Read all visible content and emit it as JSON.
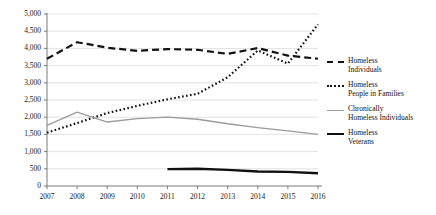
{
  "chart_data": {
    "type": "line",
    "title": "",
    "xlabel": "",
    "ylabel": "",
    "x": [
      2007,
      2008,
      2009,
      2010,
      2011,
      2012,
      2013,
      2014,
      2015,
      2016
    ],
    "categories": [
      "2007",
      "2008",
      "2009",
      "2010",
      "2011",
      "2012",
      "2013",
      "2014",
      "2015",
      "2016"
    ],
    "ylim": [
      0,
      5000
    ],
    "xlim": [
      2007,
      2016
    ],
    "ytick_values": [
      0,
      500,
      1000,
      1500,
      2000,
      2500,
      3000,
      3500,
      4000,
      4500,
      5000
    ],
    "ytick_labels": [
      "0",
      "500",
      "1,000",
      "1,500",
      "2,000",
      "2,500",
      "3,000",
      "3,500",
      "4,000",
      "4,500",
      "5,000"
    ],
    "grid": true,
    "legend_position": "right",
    "series": [
      {
        "name": "Homeless Individuals",
        "legend_label_line1": "Homeless",
        "legend_label_line2": "Individuals",
        "style": "dashed",
        "color": "#121212",
        "width": 2.2,
        "x": [
          2007,
          2008,
          2009,
          2010,
          2011,
          2012,
          2013,
          2014,
          2015,
          2016
        ],
        "values": [
          3700,
          4180,
          4020,
          3930,
          3980,
          3960,
          3840,
          4010,
          3790,
          3700
        ]
      },
      {
        "name": "Homeless People in Families",
        "legend_label_line1": "Homeless",
        "legend_label_line2": "People in Families",
        "style": "dotted",
        "color": "#121212",
        "width": 2.2,
        "x": [
          2007,
          2008,
          2009,
          2010,
          2011,
          2012,
          2013,
          2014,
          2015,
          2016
        ],
        "values": [
          1550,
          1830,
          2120,
          2330,
          2520,
          2680,
          3160,
          3940,
          3560,
          4700
        ]
      },
      {
        "name": "Chronically Homeless Individuals",
        "legend_label_line1": "Chronically",
        "legend_label_line2": "Homeless Individuals",
        "style": "solid",
        "color": "#9b9b9b",
        "width": 1.3,
        "x": [
          2007,
          2008,
          2009,
          2010,
          2011,
          2012,
          2013,
          2014,
          2015,
          2016
        ],
        "values": [
          1760,
          2150,
          1860,
          1960,
          2000,
          1940,
          1810,
          1700,
          1600,
          1500
        ]
      },
      {
        "name": "Homeless Veterans",
        "legend_label_line1": "Homeless",
        "legend_label_line2": "Veterans",
        "style": "solid",
        "color": "#101010",
        "width": 2.4,
        "x": [
          2011,
          2012,
          2013,
          2014,
          2015,
          2016
        ],
        "values": [
          490,
          500,
          470,
          420,
          410,
          370
        ]
      }
    ]
  },
  "axes": {
    "plot_left": 47,
    "plot_right": 318,
    "plot_top": 14,
    "plot_bottom": 186,
    "gridline_color": "#e2e2e2",
    "axis_color": "#7a7a7a"
  }
}
